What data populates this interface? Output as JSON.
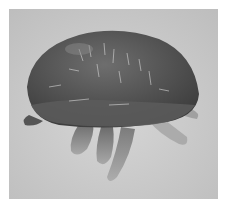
{
  "image": {
    "subject": "mite",
    "description": "Grayscale micrograph of a mite with a dark domed body and pale legs on a light gray background",
    "colors": {
      "background": "#c9c9c9",
      "body_dark": "#4a4a4a",
      "body_mid": "#6a6a6a",
      "legs": "#8a8a8a",
      "highlight": "#e0e0e0"
    }
  },
  "caption": {
    "text": "",
    "legible": false
  }
}
